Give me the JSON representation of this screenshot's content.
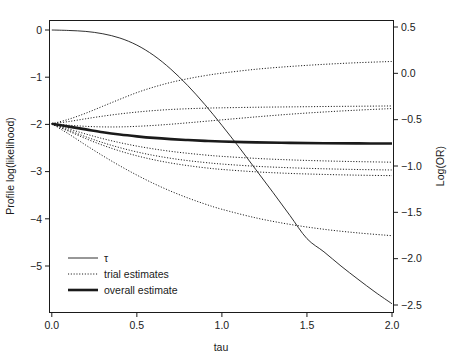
{
  "chart_data": {
    "type": "line",
    "title": "",
    "xlabel": "tau",
    "ylabel": "Profile log(likelihood)",
    "ylabel_right": "Log(OR)",
    "xlim": [
      0.0,
      2.0
    ],
    "ylim": [
      -5.8,
      0.25
    ],
    "ylim_right": [
      -2.72,
      0.62
    ],
    "grid": false,
    "xticks": [
      0.0,
      0.5,
      1.0,
      1.5,
      2.0
    ],
    "xticklabels": [
      "0.0",
      "0.5",
      "1.0",
      "1.5",
      "2.0"
    ],
    "yticks": [
      0,
      -1,
      -2,
      -3,
      -4,
      -5
    ],
    "yticklabels": [
      "0",
      "-1",
      "-2",
      "-3",
      "-4",
      "-5"
    ],
    "yticks_right": [
      0.5,
      0.0,
      -0.5,
      -1.0,
      -1.5,
      -2.0,
      -2.5
    ],
    "yticklabels_right": [
      "0.5",
      "0.0",
      "-0.5",
      "-1.0",
      "-1.5",
      "-2.0",
      "-2.5"
    ],
    "legend_position": "bottom-left",
    "legend": [
      {
        "label": "τ",
        "style": "thin-solid"
      },
      {
        "label": "trial estimates",
        "style": "dotted"
      },
      {
        "label": "overall estimate",
        "style": "thick-solid"
      }
    ],
    "series": [
      {
        "name": "tau",
        "style": "thin-solid",
        "axis": "left",
        "x": [
          0.0,
          0.1,
          0.2,
          0.3,
          0.4,
          0.5,
          0.6,
          0.7,
          0.8,
          0.9,
          1.0,
          1.1,
          1.2,
          1.3,
          1.4,
          1.5,
          1.6,
          1.7,
          1.8,
          1.9,
          2.0
        ],
        "values": [
          0.0,
          -0.01,
          -0.03,
          -0.08,
          -0.17,
          -0.32,
          -0.54,
          -0.83,
          -1.18,
          -1.58,
          -2.02,
          -2.48,
          -2.96,
          -3.44,
          -3.93,
          -4.42,
          -4.7,
          -5.0,
          -5.28,
          -5.55,
          -5.8
        ]
      },
      {
        "name": "overall estimate",
        "style": "thick-solid",
        "axis": "right",
        "x": [
          0.0,
          0.1,
          0.2,
          0.3,
          0.4,
          0.5,
          0.6,
          0.7,
          0.8,
          0.9,
          1.0,
          1.2,
          1.4,
          1.6,
          1.8,
          2.0
        ],
        "values": [
          -0.545,
          -0.575,
          -0.605,
          -0.635,
          -0.66,
          -0.68,
          -0.697,
          -0.71,
          -0.72,
          -0.729,
          -0.736,
          -0.745,
          -0.75,
          -0.754,
          -0.756,
          -0.757
        ]
      },
      {
        "name": "trial estimate 1",
        "style": "dotted",
        "axis": "right",
        "x": [
          0.0,
          0.1,
          0.2,
          0.3,
          0.4,
          0.5,
          0.6,
          0.7,
          0.8,
          0.9,
          1.0,
          1.2,
          1.4,
          1.6,
          1.8,
          2.0
        ],
        "values": [
          -0.545,
          -0.495,
          -0.43,
          -0.355,
          -0.28,
          -0.208,
          -0.148,
          -0.098,
          -0.058,
          -0.025,
          0.002,
          0.044,
          0.074,
          0.097,
          0.115,
          0.128
        ]
      },
      {
        "name": "trial estimate 2",
        "style": "dotted",
        "axis": "right",
        "x": [
          0.0,
          0.1,
          0.2,
          0.3,
          0.4,
          0.5,
          0.6,
          0.7,
          0.8,
          0.9,
          1.0,
          1.2,
          1.4,
          1.6,
          1.8,
          2.0
        ],
        "values": [
          -0.545,
          -0.52,
          -0.49,
          -0.462,
          -0.438,
          -0.418,
          -0.402,
          -0.39,
          -0.382,
          -0.376,
          -0.372,
          -0.366,
          -0.362,
          -0.358,
          -0.355,
          -0.352
        ]
      },
      {
        "name": "trial estimate 3",
        "style": "dotted",
        "axis": "right",
        "x": [
          0.0,
          0.1,
          0.2,
          0.3,
          0.4,
          0.5,
          0.6,
          0.7,
          0.8,
          0.9,
          1.0,
          1.2,
          1.4,
          1.6,
          1.8,
          2.0
        ],
        "values": [
          -0.545,
          -0.56,
          -0.572,
          -0.578,
          -0.578,
          -0.572,
          -0.562,
          -0.549,
          -0.534,
          -0.518,
          -0.502,
          -0.47,
          -0.441,
          -0.417,
          -0.397,
          -0.38
        ]
      },
      {
        "name": "trial estimate 4",
        "style": "dotted",
        "axis": "right",
        "x": [
          0.0,
          0.1,
          0.2,
          0.3,
          0.4,
          0.5,
          0.6,
          0.7,
          0.8,
          0.9,
          1.0,
          1.2,
          1.4,
          1.6,
          1.8,
          2.0
        ],
        "values": [
          -0.545,
          -0.6,
          -0.655,
          -0.705,
          -0.748,
          -0.785,
          -0.816,
          -0.842,
          -0.863,
          -0.881,
          -0.896,
          -0.918,
          -0.934,
          -0.945,
          -0.953,
          -0.959
        ]
      },
      {
        "name": "trial estimate 5",
        "style": "dotted",
        "axis": "right",
        "x": [
          0.0,
          0.1,
          0.2,
          0.3,
          0.4,
          0.5,
          0.6,
          0.7,
          0.8,
          0.9,
          1.0,
          1.2,
          1.4,
          1.6,
          1.8,
          2.0
        ],
        "values": [
          -0.545,
          -0.615,
          -0.685,
          -0.748,
          -0.802,
          -0.848,
          -0.886,
          -0.917,
          -0.942,
          -0.962,
          -0.979,
          -1.003,
          -1.019,
          -1.03,
          -1.038,
          -1.043
        ]
      },
      {
        "name": "trial estimate 6",
        "style": "dotted",
        "axis": "right",
        "x": [
          0.0,
          0.1,
          0.2,
          0.3,
          0.4,
          0.5,
          0.6,
          0.7,
          0.8,
          0.9,
          1.0,
          1.2,
          1.4,
          1.6,
          1.8,
          2.0
        ],
        "values": [
          -0.545,
          -0.625,
          -0.705,
          -0.776,
          -0.838,
          -0.89,
          -0.933,
          -0.968,
          -0.996,
          -1.019,
          -1.037,
          -1.063,
          -1.08,
          -1.091,
          -1.099,
          -1.104
        ]
      },
      {
        "name": "trial estimate 7",
        "style": "dotted",
        "axis": "right",
        "x": [
          0.0,
          0.1,
          0.2,
          0.3,
          0.4,
          0.5,
          0.6,
          0.7,
          0.8,
          0.9,
          1.0,
          1.2,
          1.4,
          1.6,
          1.8,
          2.0
        ],
        "values": [
          -0.545,
          -0.655,
          -0.775,
          -0.89,
          -0.998,
          -1.098,
          -1.19,
          -1.272,
          -1.345,
          -1.41,
          -1.467,
          -1.56,
          -1.63,
          -1.683,
          -1.722,
          -1.752
        ]
      }
    ]
  }
}
